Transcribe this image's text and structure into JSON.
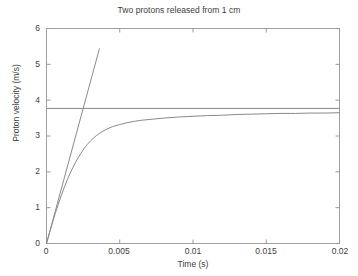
{
  "chart_data": {
    "type": "line",
    "title": "Two protons released from 1 cm",
    "xlabel": "Time (s)",
    "ylabel": "Proton velocity (m/s)",
    "xlim": [
      0,
      0.02
    ],
    "ylim": [
      0,
      6
    ],
    "xticks": [
      "0",
      "0.005",
      "0.01",
      "0.015",
      "0.02"
    ],
    "xtick_values": [
      0,
      0.005,
      0.01,
      0.015,
      0.02
    ],
    "yticks": [
      "0",
      "1",
      "2",
      "3",
      "4",
      "5",
      "6"
    ],
    "ytick_values": [
      0,
      1,
      2,
      3,
      4,
      5,
      6
    ],
    "grid": false,
    "legend": "none",
    "line_color": "#8a8a8a",
    "axis_color": "#9a9a9a",
    "background": "#ffffff",
    "series": [
      {
        "name": "proton-velocity-curve",
        "style": "solid",
        "x": [
          0,
          0.0002,
          0.0004,
          0.0006,
          0.0008,
          0.001,
          0.0012,
          0.0014,
          0.0016,
          0.0018,
          0.002,
          0.0022,
          0.0024,
          0.0026,
          0.0028,
          0.003,
          0.0032,
          0.0034,
          0.0036,
          0.004,
          0.0045,
          0.005,
          0.0055,
          0.006,
          0.0065,
          0.007,
          0.008,
          0.009,
          0.01,
          0.011,
          0.012,
          0.013,
          0.014,
          0.015,
          0.016,
          0.017,
          0.018,
          0.019,
          0.02
        ],
        "y": [
          0,
          0.29,
          0.57,
          0.84,
          1.09,
          1.33,
          1.55,
          1.76,
          1.95,
          2.12,
          2.28,
          2.42,
          2.55,
          2.67,
          2.77,
          2.86,
          2.94,
          3.01,
          3.07,
          3.17,
          3.26,
          3.32,
          3.37,
          3.41,
          3.44,
          3.46,
          3.5,
          3.53,
          3.55,
          3.57,
          3.58,
          3.6,
          3.61,
          3.62,
          3.63,
          3.63,
          3.64,
          3.64,
          3.65
        ]
      },
      {
        "name": "initial-tangent-line",
        "style": "solid",
        "x": [
          0,
          0.00362
        ],
        "y": [
          0,
          5.45
        ]
      },
      {
        "name": "terminal-velocity-asymptote",
        "style": "solid",
        "x": [
          0,
          0.02
        ],
        "y": [
          3.77,
          3.77
        ]
      }
    ]
  }
}
